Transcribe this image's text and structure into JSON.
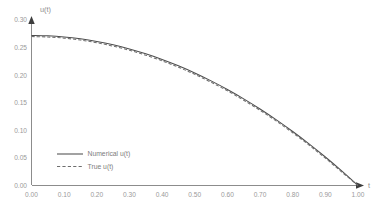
{
  "chart_data": {
    "type": "line",
    "title": "",
    "subtitle": "",
    "xlabel": "t",
    "ylabel": "u(t)",
    "xlim": [
      0.0,
      1.0
    ],
    "ylim": [
      0.0,
      0.3
    ],
    "grid": false,
    "legend_position": "inside-lower-left",
    "xticks": [
      "0.00",
      "0.10",
      "0.20",
      "0.30",
      "0.40",
      "0.50",
      "0.60",
      "0.70",
      "0.80",
      "0.90",
      "1.00"
    ],
    "xtick_values": [
      0.0,
      0.1,
      0.2,
      0.3,
      0.4,
      0.5,
      0.6,
      0.7,
      0.8,
      0.9,
      1.0
    ],
    "yticks": [
      "0.00",
      "0.05",
      "0.10",
      "0.15",
      "0.20",
      "0.25",
      "0.30"
    ],
    "ytick_values": [
      0.0,
      0.05,
      0.1,
      0.15,
      0.2,
      0.25,
      0.3
    ],
    "x": [
      0.0,
      0.05,
      0.1,
      0.15,
      0.2,
      0.25,
      0.3,
      0.35,
      0.4,
      0.45,
      0.5,
      0.55,
      0.6,
      0.65,
      0.7,
      0.75,
      0.8,
      0.85,
      0.9,
      0.95,
      1.0
    ],
    "series": [
      {
        "name": "Numerical u(t)",
        "style": "solid",
        "color": "#4d4d4d",
        "values": [
          0.272,
          0.2713,
          0.2693,
          0.2659,
          0.2611,
          0.255,
          0.2476,
          0.2387,
          0.2285,
          0.217,
          0.204,
          0.1897,
          0.1741,
          0.1571,
          0.1387,
          0.119,
          0.0979,
          0.0755,
          0.0517,
          0.0265,
          0.0
        ]
      },
      {
        "name": "True u(t)",
        "style": "dashed",
        "color": "#6e6e6e",
        "values": [
          0.27,
          0.2692,
          0.2671,
          0.2636,
          0.2588,
          0.2526,
          0.2451,
          0.2362,
          0.226,
          0.2144,
          0.2015,
          0.1872,
          0.1716,
          0.1546,
          0.1363,
          0.1166,
          0.0956,
          0.0733,
          0.0496,
          0.0246,
          0.0
        ]
      }
    ]
  },
  "legend": {
    "items": [
      {
        "label": "Numerical u(t)",
        "style": "solid"
      },
      {
        "label": "True u(t)",
        "style": "dashed"
      }
    ]
  },
  "axes": {
    "y_axis_title": "u(t)",
    "x_axis_title": "t"
  }
}
